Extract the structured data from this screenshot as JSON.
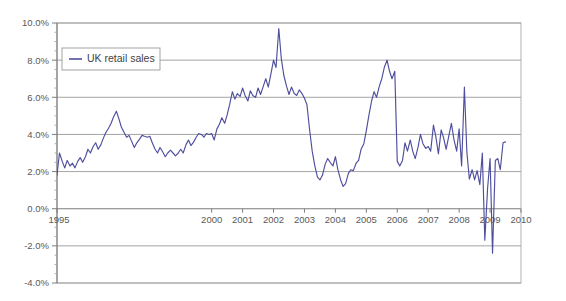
{
  "chart_data": {
    "type": "line",
    "title": "",
    "subtitle": "",
    "xlabel": "",
    "ylabel": "",
    "grid": true,
    "legend_position": "top-left",
    "xlim": [
      1995.0,
      2010.0
    ],
    "ylim": [
      -4.0,
      10.0
    ],
    "y_tick_labels": [
      "10.0%",
      "8.0%",
      "6.0%",
      "4.0%",
      "2.0%",
      "0.0%",
      "-2.0%",
      "-4.0%"
    ],
    "y_tick_values": [
      10.0,
      8.0,
      6.0,
      4.0,
      2.0,
      0.0,
      -2.0,
      -4.0
    ],
    "y_minor_step": 0.5,
    "x_tick_labels": [
      "1995",
      "2000",
      "2001",
      "2002",
      "2003",
      "2004",
      "2005",
      "2006",
      "2007",
      "2008",
      "2009",
      "2010"
    ],
    "x_tick_values": [
      1995,
      2000,
      2001,
      2002,
      2003,
      2004,
      2005,
      2006,
      2007,
      2008,
      2009,
      2010
    ],
    "series": [
      {
        "name": "UK retail sales",
        "color": "#4e4e9e",
        "x": [
          1995.0,
          1995.08,
          1995.17,
          1995.25,
          1995.33,
          1995.42,
          1995.5,
          1995.58,
          1995.67,
          1995.75,
          1995.83,
          1995.92,
          1996.0,
          1996.08,
          1996.17,
          1996.25,
          1996.33,
          1996.42,
          1996.5,
          1996.58,
          1996.67,
          1996.75,
          1996.83,
          1996.92,
          1997.0,
          1997.08,
          1997.17,
          1997.25,
          1997.33,
          1997.42,
          1997.5,
          1997.58,
          1997.67,
          1997.75,
          1997.83,
          1997.92,
          1998.0,
          1998.08,
          1998.17,
          1998.25,
          1998.33,
          1998.42,
          1998.5,
          1998.58,
          1998.67,
          1998.75,
          1998.83,
          1998.92,
          1999.0,
          1999.08,
          1999.17,
          1999.25,
          1999.33,
          1999.42,
          1999.5,
          1999.58,
          1999.67,
          1999.75,
          1999.83,
          1999.92,
          2000.0,
          2000.08,
          2000.17,
          2000.25,
          2000.33,
          2000.42,
          2000.5,
          2000.58,
          2000.67,
          2000.75,
          2000.83,
          2000.92,
          2001.0,
          2001.08,
          2001.17,
          2001.25,
          2001.33,
          2001.42,
          2001.5,
          2001.58,
          2001.67,
          2001.75,
          2001.83,
          2001.92,
          2002.0,
          2002.08,
          2002.17,
          2002.25,
          2002.33,
          2002.42,
          2002.5,
          2002.58,
          2002.67,
          2002.75,
          2002.83,
          2002.92,
          2003.0,
          2003.08,
          2003.17,
          2003.25,
          2003.33,
          2003.42,
          2003.5,
          2003.58,
          2003.67,
          2003.75,
          2003.83,
          2003.92,
          2004.0,
          2004.08,
          2004.17,
          2004.25,
          2004.33,
          2004.42,
          2004.5,
          2004.58,
          2004.67,
          2004.75,
          2004.83,
          2004.92,
          2005.0,
          2005.08,
          2005.17,
          2005.25,
          2005.33,
          2005.42,
          2005.5,
          2005.58,
          2005.67,
          2005.75,
          2005.83,
          2005.92,
          2006.0,
          2006.08,
          2006.17,
          2006.25,
          2006.33,
          2006.42,
          2006.5,
          2006.58,
          2006.67,
          2006.75,
          2006.83,
          2006.92,
          2007.0,
          2007.08,
          2007.17,
          2007.25,
          2007.33,
          2007.42,
          2007.5,
          2007.58,
          2007.67,
          2007.75,
          2007.83,
          2007.92,
          2008.0,
          2008.08,
          2008.17,
          2008.25,
          2008.33,
          2008.42,
          2008.5,
          2008.58,
          2008.67,
          2008.75,
          2008.83,
          2008.92,
          2009.0,
          2009.08,
          2009.17,
          2009.25,
          2009.33,
          2009.42,
          2009.5
        ],
        "values": [
          1.8,
          3.0,
          2.55,
          2.2,
          2.6,
          2.3,
          2.45,
          2.2,
          2.55,
          2.75,
          2.5,
          2.8,
          3.2,
          3.0,
          3.35,
          3.55,
          3.2,
          3.45,
          3.8,
          4.1,
          4.35,
          4.6,
          4.95,
          5.25,
          4.85,
          4.4,
          4.1,
          3.85,
          3.95,
          3.6,
          3.3,
          3.55,
          3.75,
          3.95,
          3.9,
          3.85,
          3.9,
          3.55,
          3.2,
          3.0,
          3.3,
          3.05,
          2.8,
          3.0,
          3.15,
          3.0,
          2.85,
          3.0,
          3.2,
          3.0,
          3.45,
          3.7,
          3.4,
          3.6,
          3.85,
          4.05,
          4.0,
          3.85,
          4.05,
          4.0,
          4.05,
          3.7,
          4.3,
          4.55,
          4.9,
          4.6,
          5.05,
          5.6,
          6.3,
          5.9,
          6.2,
          6.05,
          6.5,
          6.1,
          5.8,
          6.35,
          6.1,
          6.0,
          6.5,
          6.15,
          6.6,
          7.0,
          6.55,
          7.3,
          8.0,
          7.6,
          9.7,
          8.1,
          7.2,
          6.6,
          6.15,
          6.55,
          6.2,
          6.1,
          6.4,
          6.2,
          5.95,
          5.6,
          4.2,
          3.1,
          2.35,
          1.7,
          1.55,
          1.8,
          2.4,
          2.7,
          2.5,
          2.3,
          2.8,
          2.1,
          1.55,
          1.2,
          1.35,
          1.9,
          2.1,
          2.05,
          2.45,
          2.6,
          3.2,
          3.5,
          4.2,
          5.0,
          5.8,
          6.3,
          6.0,
          6.6,
          7.0,
          7.6,
          8.0,
          7.4,
          7.0,
          7.4,
          7.2,
          6.9,
          6.3,
          6.4,
          6.5,
          6.4,
          5.8,
          5.0,
          4.2,
          4.6,
          4.0,
          3.5,
          3.1,
          2.8,
          2.2,
          1.8,
          1.6,
          1.2,
          1.35,
          1.65,
          1.9,
          1.4,
          1.2,
          1.55,
          2.2,
          2.0,
          2.45,
          2.8,
          2.6,
          2.3,
          2.05,
          2.0,
          2.1,
          2.0,
          2.05,
          2.1,
          2.0,
          2.5,
          3.0,
          3.4,
          3.2,
          2.8,
          3.1
        ]
      }
    ],
    "series_extra": {
      "note": "Monthly UK retail sales year-on-year growth rate, Jan 1995 through mid 2009",
      "tail_x": [
        2006.0,
        2006.08,
        2006.17,
        2006.25,
        2006.33,
        2006.42,
        2006.5,
        2006.58,
        2006.67,
        2006.75,
        2006.83,
        2006.92,
        2007.0,
        2007.08,
        2007.17,
        2007.25,
        2007.33,
        2007.42,
        2007.5,
        2007.58,
        2007.67,
        2007.75,
        2007.83,
        2007.92,
        2008.0,
        2008.08,
        2008.17,
        2008.25,
        2008.33,
        2008.42,
        2008.5,
        2008.58,
        2008.67,
        2008.75,
        2008.83,
        2008.92,
        2009.0,
        2009.08,
        2009.17,
        2009.25,
        2009.33,
        2009.42,
        2009.5
      ],
      "tail_values": [
        2.55,
        2.3,
        2.6,
        3.55,
        3.1,
        3.7,
        3.1,
        2.7,
        3.3,
        4.0,
        3.5,
        3.25,
        3.35,
        3.1,
        4.5,
        3.85,
        2.95,
        4.25,
        3.8,
        3.2,
        3.95,
        4.6,
        3.75,
        3.1,
        4.3,
        2.3,
        6.55,
        3.05,
        1.6,
        2.1,
        1.55,
        2.05,
        1.3,
        3.0,
        -1.7,
        1.1,
        2.7,
        -2.4,
        2.6,
        2.7,
        2.1,
        3.55,
        3.6
      ]
    }
  },
  "legend": {
    "entries": [
      {
        "label": "UK retail sales",
        "color": "#4e4e9e",
        "marker": "line-swatch"
      }
    ]
  },
  "axes": {
    "y_axis_name": "percent-axis",
    "x_axis_name": "year-axis"
  }
}
